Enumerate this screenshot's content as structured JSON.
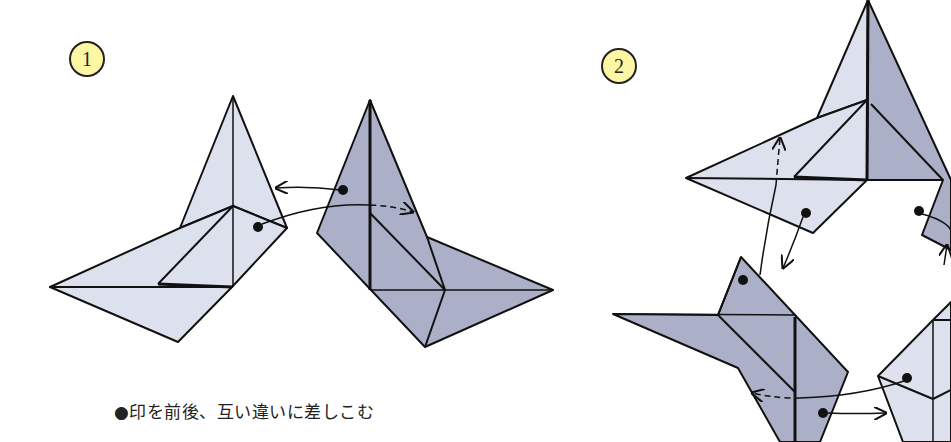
{
  "steps": [
    {
      "number": "1",
      "instruction": "●印を前後、互い違いに差しこむ"
    },
    {
      "number": "2"
    }
  ],
  "colors": {
    "light_unit": "#dde1ee",
    "dark_unit": "#abb0c8",
    "badge": "#fdf6a2",
    "line": "#111111"
  }
}
